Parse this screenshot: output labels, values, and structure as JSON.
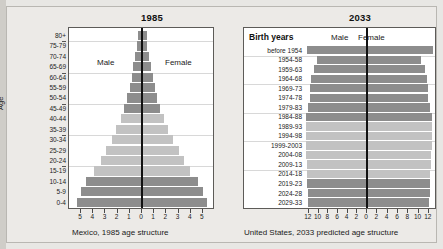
{
  "figure": {
    "background_color": "#e8e7e4",
    "bar_color_dark": "#8d8d8d",
    "bar_color_light": "#c2c2c2"
  },
  "left_panel": {
    "title": "1985",
    "caption": "Mexico, 1985 age structure",
    "axis_title": "Age",
    "male_label": "Male",
    "female_label": "Female"
  },
  "right_panel": {
    "title": "2033",
    "caption": "United States, 2033 predicted age structure",
    "axis_title": "Birth years",
    "male_label": "Male",
    "female_label": "Female"
  },
  "chart_data": [
    {
      "type": "bar",
      "subtype": "population-pyramid",
      "title": "1985",
      "subtitle": "Mexico, 1985 age structure",
      "xlabel": "",
      "ylabel": "Age",
      "orientation": "horizontal",
      "grid": true,
      "legend_position": "inside-plot",
      "xlim": [
        -5.5,
        5.5
      ],
      "xticks": [
        5,
        4,
        3,
        2,
        1,
        0,
        1,
        2,
        3,
        4,
        5
      ],
      "xtick_values": [
        -5,
        -4,
        -3,
        -2,
        -1,
        0,
        1,
        2,
        3,
        4,
        5
      ],
      "categories": [
        "80+",
        "75-79",
        "70-74",
        "65-69",
        "60-64",
        "55-59",
        "50-54",
        "45-49",
        "40-44",
        "35-39",
        "30-34",
        "25-29",
        "20-24",
        "15-19",
        "10-14",
        "5-9",
        "0-4"
      ],
      "series": [
        {
          "name": "Male",
          "side": "left",
          "values": [
            0.35,
            0.4,
            0.55,
            0.7,
            0.85,
            1.0,
            1.2,
            1.45,
            1.75,
            2.1,
            2.5,
            2.95,
            3.4,
            3.9,
            4.6,
            5.0,
            5.3
          ]
        },
        {
          "name": "Female",
          "side": "right",
          "values": [
            0.4,
            0.45,
            0.6,
            0.75,
            0.9,
            1.05,
            1.25,
            1.5,
            1.8,
            2.15,
            2.55,
            3.0,
            3.45,
            3.95,
            4.6,
            5.0,
            5.3
          ]
        }
      ],
      "shade_by_row": [
        "dark",
        "dark",
        "dark",
        "dark",
        "dark",
        "dark",
        "dark",
        "dark",
        "light",
        "light",
        "light",
        "light",
        "light",
        "light",
        "dark",
        "dark",
        "dark"
      ]
    },
    {
      "type": "bar",
      "subtype": "population-pyramid",
      "title": "2033",
      "subtitle": "United States, 2033 predicted age structure",
      "xlabel": "",
      "ylabel": "Birth years",
      "orientation": "horizontal",
      "grid": true,
      "legend_position": "inside-plot",
      "xlim": [
        -13,
        13
      ],
      "xticks": [
        12,
        10,
        8,
        6,
        4,
        2,
        0,
        2,
        4,
        6,
        8,
        10,
        12
      ],
      "xtick_values": [
        -12,
        -10,
        -8,
        -6,
        -4,
        -2,
        0,
        2,
        4,
        6,
        8,
        10,
        12
      ],
      "categories": [
        "before 1954",
        "1954-58",
        "1959-63",
        "1964-68",
        "1969-73",
        "1974-78",
        "1979-83",
        "1984-88",
        "1989-93",
        "1994-98",
        "1999-2003",
        "2004-08",
        "2009-13",
        "2014-18",
        "2019-23",
        "2024-28",
        "2029-33"
      ],
      "series": [
        {
          "name": "Male",
          "side": "left",
          "values": [
            12.4,
            10.3,
            11.0,
            11.6,
            11.8,
            11.7,
            12.2,
            12.6,
            12.6,
            12.5,
            12.6,
            12.5,
            12.4,
            12.3,
            12.3,
            12.2,
            12.1
          ]
        },
        {
          "name": "Female",
          "side": "right",
          "values": [
            12.8,
            10.5,
            11.2,
            11.7,
            11.9,
            11.8,
            12.3,
            12.7,
            12.7,
            12.6,
            12.6,
            12.5,
            12.4,
            12.3,
            12.3,
            12.2,
            12.1
          ]
        }
      ],
      "shade_by_row": [
        "dark",
        "dark",
        "dark",
        "dark",
        "dark",
        "dark",
        "dark",
        "dark",
        "light",
        "light",
        "light",
        "light",
        "light",
        "light",
        "dark",
        "dark",
        "dark"
      ]
    }
  ]
}
